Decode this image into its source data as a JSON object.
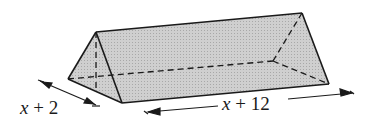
{
  "diagram": {
    "type": "triangular-prism",
    "fill_color": "#c4c4c4",
    "stroke_color": "#1a1a1a",
    "labels": {
      "width": {
        "var": "x",
        "rest": " + 2"
      },
      "length": {
        "var": "x",
        "rest": " + 12"
      }
    }
  }
}
